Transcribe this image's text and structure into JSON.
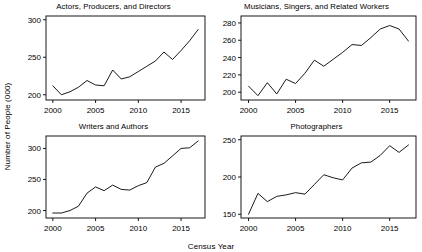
{
  "figure": {
    "ylabel": "Number of People (000)",
    "xlabel": "Census Year"
  },
  "chart_data": [
    {
      "type": "line",
      "title": "Actors, Producers, and Directors",
      "xlabel": "Census Year",
      "ylabel": "Number of People (000)",
      "xlim": [
        1999.2,
        2017.8
      ],
      "ylim": [
        193,
        305
      ],
      "xticks": [
        2000,
        2005,
        2010,
        2015
      ],
      "yticks": [
        200,
        250,
        300
      ],
      "grid": false,
      "legend": "none",
      "x": [
        2000,
        2001,
        2002,
        2003,
        2004,
        2005,
        2006,
        2007,
        2008,
        2009,
        2010,
        2011,
        2012,
        2013,
        2014,
        2015,
        2016,
        2017
      ],
      "values": [
        212,
        200,
        204,
        210,
        219,
        213,
        212,
        233,
        221,
        224,
        231,
        238,
        245,
        257,
        247,
        259,
        272,
        287
      ]
    },
    {
      "type": "line",
      "title": "Musicians, Singers, and Related Workers",
      "xlabel": "Census Year",
      "ylabel": "Number of People (000)",
      "xlim": [
        1999.2,
        2017.8
      ],
      "ylim": [
        191,
        288
      ],
      "xticks": [
        2000,
        2005,
        2010,
        2015
      ],
      "yticks": [
        200,
        220,
        240,
        260,
        280
      ],
      "grid": false,
      "legend": "none",
      "x": [
        2000,
        2001,
        2002,
        2003,
        2004,
        2005,
        2006,
        2007,
        2008,
        2009,
        2010,
        2011,
        2012,
        2013,
        2014,
        2015,
        2016,
        2017
      ],
      "values": [
        207,
        196,
        211,
        198,
        215,
        210,
        222,
        237,
        230,
        238,
        246,
        255,
        254,
        263,
        273,
        277,
        273,
        259
      ]
    },
    {
      "type": "line",
      "title": "Writers and Authors",
      "xlabel": "Census Year",
      "ylabel": "Number of People (000)",
      "xlim": [
        1999.2,
        2017.8
      ],
      "ylim": [
        188,
        320
      ],
      "xticks": [
        2000,
        2005,
        2010,
        2015
      ],
      "yticks": [
        200,
        250,
        300
      ],
      "grid": false,
      "legend": "none",
      "x": [
        2000,
        2001,
        2002,
        2003,
        2004,
        2005,
        2006,
        2007,
        2008,
        2009,
        2010,
        2011,
        2012,
        2013,
        2014,
        2015,
        2016,
        2017
      ],
      "values": [
        196,
        196,
        200,
        207,
        228,
        238,
        232,
        241,
        234,
        233,
        240,
        245,
        270,
        276,
        288,
        300,
        301,
        312
      ]
    },
    {
      "type": "line",
      "title": "Photographers",
      "xlabel": "Census Year",
      "ylabel": "Number of People (000)",
      "xlim": [
        1999.2,
        2017.8
      ],
      "ylim": [
        145,
        255
      ],
      "xticks": [
        2000,
        2005,
        2010,
        2015
      ],
      "yticks": [
        150,
        200,
        250
      ],
      "grid": false,
      "legend": "none",
      "x": [
        2000,
        2001,
        2002,
        2003,
        2004,
        2005,
        2006,
        2007,
        2008,
        2009,
        2010,
        2011,
        2012,
        2013,
        2014,
        2015,
        2016,
        2017
      ],
      "values": [
        150,
        178,
        167,
        174,
        176,
        179,
        177,
        190,
        203,
        199,
        196,
        212,
        219,
        220,
        229,
        242,
        233,
        243
      ]
    }
  ]
}
